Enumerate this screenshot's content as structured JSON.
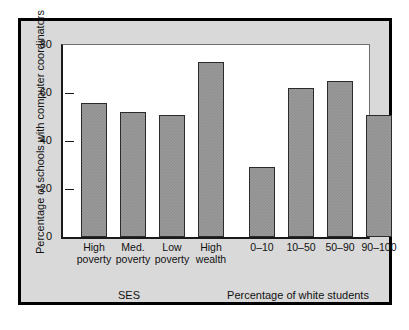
{
  "chart_data": {
    "type": "bar",
    "title": "",
    "xlabel": "",
    "ylabel": "Percentage of schools with computer coordinators",
    "ylim": [
      0,
      80
    ],
    "yticks": [
      0,
      20,
      40,
      60,
      80
    ],
    "grid": false,
    "legend": null,
    "groups": [
      {
        "name": "SES",
        "categories": [
          "High poverty",
          "Med. poverty",
          "Low poverty",
          "High wealth"
        ],
        "values": [
          56,
          52,
          51,
          73
        ]
      },
      {
        "name": "Percentage of white students",
        "categories": [
          "0–10",
          "10–50",
          "50–90",
          "90–100"
        ],
        "values": [
          29,
          62,
          65,
          51
        ]
      }
    ],
    "categories": [
      "High poverty",
      "Med. poverty",
      "Low poverty",
      "High wealth",
      "0–10",
      "10–50",
      "50–90",
      "90–100"
    ],
    "values": [
      56,
      52,
      51,
      73,
      29,
      62,
      65,
      51
    ],
    "bar_color": "#9a9a9a",
    "bar_edge_color": "#2b2b2b"
  },
  "axis": {
    "y_title": "Percentage of schools with computer coordinators",
    "tick_80": "80",
    "tick_60": "60",
    "tick_40": "40",
    "tick_20": "20",
    "tick_0": "0"
  },
  "categories": {
    "bar1_line1": "High",
    "bar1_line2": "poverty",
    "bar2_line1": "Med.",
    "bar2_line2": "poverty",
    "bar3_line1": "Low",
    "bar3_line2": "poverty",
    "bar4_line1": "High",
    "bar4_line2": "wealth",
    "bar5": "0–10",
    "bar6": "10–50",
    "bar7": "50–90",
    "bar8": "90–100"
  },
  "group_titles": {
    "left": "SES",
    "right": "Percentage of white students"
  },
  "colors": {
    "frame": "#000000",
    "figure_bg": "#d9d9d9",
    "plot_bg": "#ffffff",
    "bar_fill": "#9a9a9a",
    "bar_edge": "#2b2b2b",
    "text": "#111111"
  }
}
